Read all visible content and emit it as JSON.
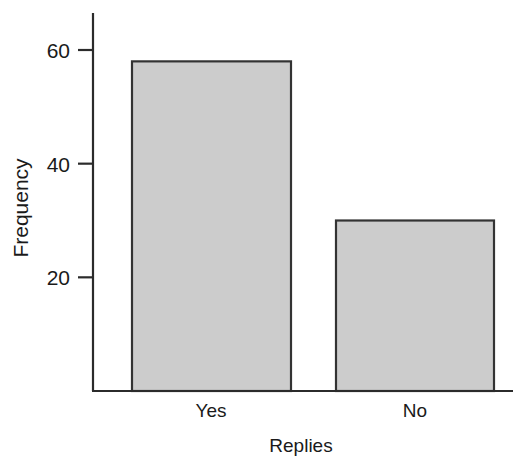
{
  "chart_data": {
    "type": "bar",
    "title": "",
    "subtitle": "",
    "xlabel": "Replies",
    "ylabel": "Frequency",
    "categories": [
      "Yes",
      "No"
    ],
    "values": [
      58,
      30
    ],
    "ylim": [
      0,
      65
    ],
    "yticks": [
      20,
      40,
      60
    ],
    "ytick_labels": [
      "20",
      "40",
      "60"
    ],
    "xtick_labels": [
      "Yes",
      "No"
    ],
    "grid": false,
    "legend": null,
    "legend_position": "none",
    "bar_fill_color": "#cccccc",
    "bar_border_color": "#333333",
    "axis_color": "#2b2b2b",
    "background_color": "#ffffff"
  },
  "axis": {
    "y_tick_0": "20",
    "y_tick_1": "40",
    "y_tick_2": "60",
    "x_cat_0": "Yes",
    "x_cat_1": "No",
    "x_title": "Replies",
    "y_title": "Frequency"
  }
}
